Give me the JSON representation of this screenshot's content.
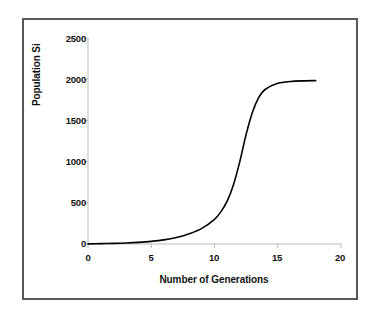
{
  "chart_data": {
    "type": "line",
    "title": "",
    "xlabel": "Number of Generations",
    "ylabel": "Population Si",
    "xlim": [
      0,
      20
    ],
    "ylim": [
      0,
      2500
    ],
    "grid": false,
    "legend": null,
    "xticks": [
      "0",
      "5",
      "10",
      "15",
      "20"
    ],
    "xtick_values": [
      0,
      5,
      10,
      15,
      20
    ],
    "yticks": [
      "0",
      "500",
      "1000",
      "1500",
      "2000",
      "2500"
    ],
    "ytick_values": [
      0,
      500,
      1000,
      1500,
      2000,
      2500
    ],
    "series": [
      {
        "name": "Population",
        "color": "#000000",
        "x": [
          0,
          1,
          2,
          3,
          4,
          5,
          6,
          7,
          8,
          9,
          10,
          10.5,
          11,
          11.5,
          12,
          12.5,
          13,
          13.5,
          14,
          15,
          16,
          17,
          18
        ],
        "values": [
          2,
          4,
          7,
          12,
          20,
          32,
          50,
          80,
          125,
          190,
          300,
          390,
          520,
          720,
          1000,
          1330,
          1600,
          1780,
          1875,
          1950,
          1972,
          1980,
          1983
        ]
      }
    ],
    "annotations": []
  },
  "axis": {
    "x_start": 0,
    "x_end": 20,
    "y_start": 0,
    "y_end": 2500
  },
  "style": {
    "frame_color": "#58585a",
    "axis_color": "#b9b9b9",
    "curve_color": "#000000",
    "background": "#ffffff",
    "text_color": "#111111"
  }
}
